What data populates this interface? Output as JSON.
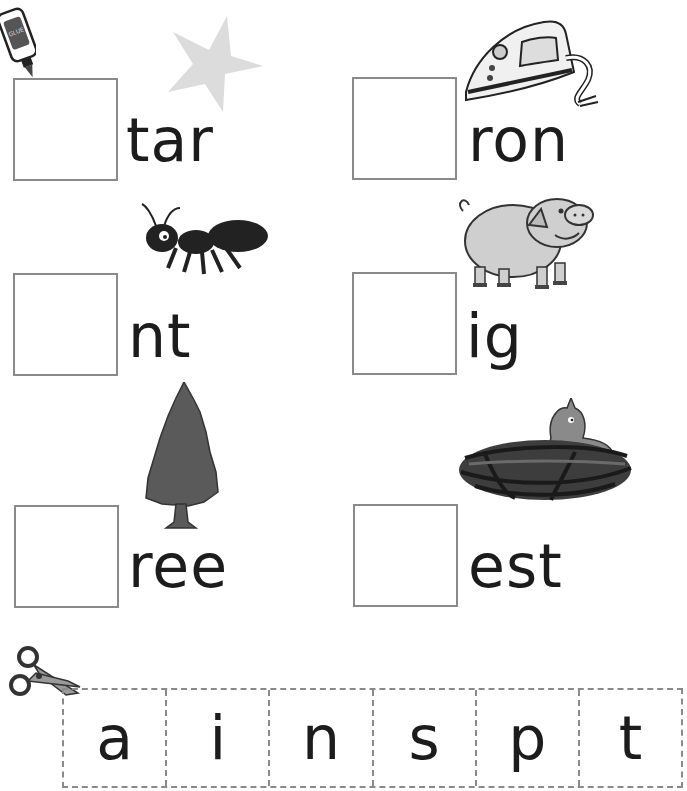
{
  "worksheet": {
    "items": [
      {
        "picture": "star",
        "word_ending": "tar"
      },
      {
        "picture": "iron",
        "word_ending": "ron"
      },
      {
        "picture": "ant",
        "word_ending": "nt"
      },
      {
        "picture": "pig",
        "word_ending": "ig"
      },
      {
        "picture": "tree",
        "word_ending": "ree"
      },
      {
        "picture": "nest",
        "word_ending": "est"
      }
    ],
    "cutout_letters": [
      "a",
      "i",
      "n",
      "s",
      "p",
      "t"
    ]
  }
}
